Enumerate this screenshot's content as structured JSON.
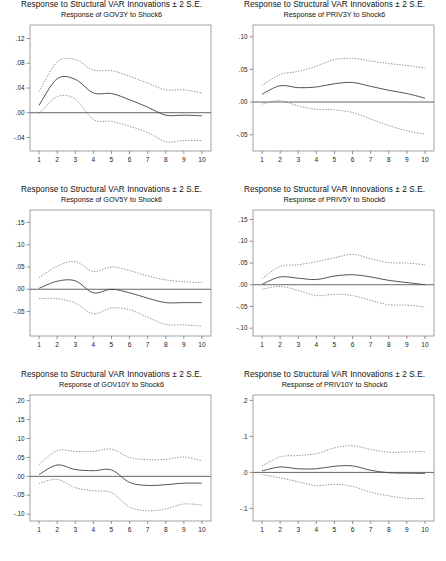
{
  "page": {
    "background": "#ffffff",
    "layout": "3 rows x 2 columns of impulse response plots"
  },
  "colors": {
    "main_line": "#4a4a4a",
    "band_line": "#777777",
    "frame": "#8a8a8a",
    "zero_line": "#555555",
    "text": "#1a1a1a"
  },
  "common": {
    "title": "Response to Structural VAR Innovations ± 2 S.E.",
    "xlabel": "",
    "x_ticks": [
      "1",
      "2",
      "3",
      "4",
      "5",
      "6",
      "7",
      "8",
      "9",
      "10"
    ]
  },
  "chart_data": [
    {
      "id": "gov3y",
      "type": "line",
      "title": "Response to Structural VAR Innovations ± 2 S.E.",
      "subtitle": "Response of GOV3Y to Shock6",
      "xlabel": "",
      "ylabel": "",
      "x": [
        1,
        2,
        3,
        4,
        5,
        6,
        7,
        8,
        9,
        10
      ],
      "xlim": [
        0.5,
        10.5
      ],
      "ylim": [
        -0.062,
        0.142
      ],
      "y_ticks": [
        0.12,
        0.08,
        0.04,
        0.0,
        -0.04
      ],
      "y_tick_labels": [
        ".12",
        ".08",
        ".04",
        ".00",
        "-.04"
      ],
      "grid": false,
      "legend": "none",
      "series": [
        {
          "name": "upper_2se",
          "style": "dashed",
          "values": [
            0.034,
            0.082,
            0.086,
            0.069,
            0.068,
            0.059,
            0.048,
            0.037,
            0.037,
            0.032
          ]
        },
        {
          "name": "response",
          "style": "solid",
          "values": [
            0.012,
            0.055,
            0.054,
            0.032,
            0.031,
            0.021,
            0.009,
            -0.004,
            -0.004,
            -0.005
          ]
        },
        {
          "name": "lower_2se",
          "style": "dashed",
          "values": [
            -0.002,
            0.026,
            0.022,
            -0.011,
            -0.014,
            -0.022,
            -0.032,
            -0.047,
            -0.045,
            -0.045
          ]
        }
      ]
    },
    {
      "id": "priv3y",
      "type": "line",
      "title": "Response to Structural VAR Innovations ± 2 S.E.",
      "subtitle": "Response of PRIV3Y to Shock6",
      "xlabel": "",
      "ylabel": "",
      "x": [
        1,
        2,
        3,
        4,
        5,
        6,
        7,
        8,
        9,
        10
      ],
      "xlim": [
        0.5,
        10.5
      ],
      "ylim": [
        -0.075,
        0.118
      ],
      "y_ticks": [
        0.1,
        0.05,
        0.0,
        -0.05
      ],
      "y_tick_labels": [
        ".10",
        ".05",
        ".00",
        "-.05"
      ],
      "grid": false,
      "legend": "none",
      "series": [
        {
          "name": "upper_2se",
          "style": "dashed",
          "values": [
            0.026,
            0.042,
            0.047,
            0.055,
            0.065,
            0.067,
            0.063,
            0.059,
            0.056,
            0.052
          ]
        },
        {
          "name": "response",
          "style": "solid",
          "values": [
            0.012,
            0.025,
            0.022,
            0.023,
            0.028,
            0.03,
            0.024,
            0.018,
            0.013,
            0.006
          ]
        },
        {
          "name": "lower_2se",
          "style": "dashed",
          "values": [
            -0.003,
            0.002,
            -0.006,
            -0.011,
            -0.012,
            -0.016,
            -0.026,
            -0.036,
            -0.044,
            -0.049
          ]
        }
      ]
    },
    {
      "id": "gov5y",
      "type": "line",
      "title": "Response to Structural VAR Innovations ± 2 S.E.",
      "subtitle": "Response of GOV5Y to Shock6",
      "xlabel": "",
      "ylabel": "",
      "x": [
        1,
        2,
        3,
        4,
        5,
        6,
        7,
        8,
        9,
        10
      ],
      "xlim": [
        0.5,
        10.5
      ],
      "ylim": [
        -0.105,
        0.178
      ],
      "y_ticks": [
        0.15,
        0.1,
        0.05,
        0.0,
        -0.05
      ],
      "y_tick_labels": [
        ".15",
        ".10",
        ".05",
        ".00",
        "-.05"
      ],
      "grid": false,
      "legend": "none",
      "series": [
        {
          "name": "upper_2se",
          "style": "dashed",
          "values": [
            0.026,
            0.052,
            0.062,
            0.04,
            0.05,
            0.042,
            0.03,
            0.021,
            0.017,
            0.015
          ]
        },
        {
          "name": "response",
          "style": "solid",
          "values": [
            0.002,
            0.018,
            0.019,
            -0.008,
            0.0,
            -0.008,
            -0.02,
            -0.03,
            -0.03,
            -0.03
          ]
        },
        {
          "name": "lower_2se",
          "style": "dashed",
          "values": [
            -0.021,
            -0.021,
            -0.031,
            -0.055,
            -0.042,
            -0.046,
            -0.063,
            -0.079,
            -0.08,
            -0.083
          ]
        }
      ]
    },
    {
      "id": "priv5y",
      "type": "line",
      "title": "Response to Structural VAR Innovations ± 2 S.E.",
      "subtitle": "Response of PRIV5Y to Shock6",
      "xlabel": "",
      "ylabel": "",
      "x": [
        1,
        2,
        3,
        4,
        5,
        6,
        7,
        8,
        9,
        10
      ],
      "xlim": [
        0.5,
        10.5
      ],
      "ylim": [
        -0.118,
        0.172
      ],
      "y_ticks": [
        0.15,
        0.1,
        0.05,
        0.0,
        -0.05,
        -0.1
      ],
      "y_tick_labels": [
        ".15",
        ".10",
        ".05",
        ".00",
        "-.05",
        "-.10"
      ],
      "grid": false,
      "legend": "none",
      "series": [
        {
          "name": "upper_2se",
          "style": "dashed",
          "values": [
            0.014,
            0.042,
            0.046,
            0.053,
            0.062,
            0.07,
            0.06,
            0.051,
            0.05,
            0.046
          ]
        },
        {
          "name": "response",
          "style": "solid",
          "values": [
            0.001,
            0.018,
            0.015,
            0.012,
            0.02,
            0.023,
            0.018,
            0.01,
            0.005,
            0.0
          ]
        },
        {
          "name": "lower_2se",
          "style": "dashed",
          "values": [
            -0.01,
            -0.004,
            -0.013,
            -0.025,
            -0.022,
            -0.025,
            -0.036,
            -0.046,
            -0.047,
            -0.051
          ]
        }
      ]
    },
    {
      "id": "gov10y",
      "type": "line",
      "title": "Response to Structural VAR Innovations ± 2 S.E.",
      "subtitle": "Response of GOV10Y to Shock6",
      "xlabel": "",
      "ylabel": "",
      "x": [
        1,
        2,
        3,
        4,
        5,
        6,
        7,
        8,
        9,
        10
      ],
      "xlim": [
        0.5,
        10.5
      ],
      "ylim": [
        -0.118,
        0.215
      ],
      "y_ticks": [
        0.2,
        0.15,
        0.1,
        0.05,
        0.0,
        -0.05,
        -0.1
      ],
      "y_tick_labels": [
        ".20",
        ".15",
        ".10",
        ".05",
        ".00",
        "-.05",
        "-.10"
      ],
      "grid": false,
      "legend": "none",
      "series": [
        {
          "name": "upper_2se",
          "style": "dashed",
          "values": [
            0.031,
            0.068,
            0.066,
            0.066,
            0.072,
            0.05,
            0.044,
            0.045,
            0.051,
            0.041
          ]
        },
        {
          "name": "response",
          "style": "solid",
          "values": [
            0.005,
            0.03,
            0.018,
            0.015,
            0.017,
            -0.016,
            -0.024,
            -0.022,
            -0.018,
            -0.018
          ]
        },
        {
          "name": "lower_2se",
          "style": "dashed",
          "values": [
            -0.019,
            -0.008,
            -0.03,
            -0.038,
            -0.043,
            -0.081,
            -0.091,
            -0.086,
            -0.073,
            -0.076
          ]
        }
      ]
    },
    {
      "id": "priv10y",
      "type": "line",
      "title": "Response to Structural VAR Innovations ± 2 S.E.",
      "subtitle": "Response of PRIV10Y to Shock6",
      "xlabel": "",
      "ylabel": "",
      "x": [
        1,
        2,
        3,
        4,
        5,
        6,
        7,
        8,
        9,
        10
      ],
      "xlim": [
        0.5,
        10.5
      ],
      "ylim": [
        -0.135,
        0.215
      ],
      "y_ticks": [
        0.2,
        0.1,
        0.0,
        -0.1
      ],
      "y_tick_labels": [
        ".2",
        ".1",
        ".0",
        "-.1"
      ],
      "grid": false,
      "legend": "none",
      "series": [
        {
          "name": "upper_2se",
          "style": "dashed",
          "values": [
            0.018,
            0.043,
            0.047,
            0.052,
            0.068,
            0.074,
            0.064,
            0.056,
            0.057,
            0.058
          ]
        },
        {
          "name": "response",
          "style": "solid",
          "values": [
            0.004,
            0.015,
            0.01,
            0.01,
            0.017,
            0.018,
            0.006,
            -0.001,
            -0.002,
            -0.003
          ]
        },
        {
          "name": "lower_2se",
          "style": "dashed",
          "values": [
            -0.006,
            -0.015,
            -0.026,
            -0.037,
            -0.033,
            -0.039,
            -0.055,
            -0.065,
            -0.072,
            -0.073
          ]
        }
      ]
    }
  ]
}
